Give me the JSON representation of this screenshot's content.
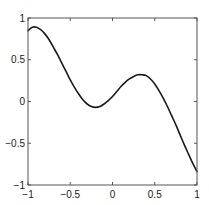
{
  "chart_data": {
    "type": "line",
    "title": "",
    "xlabel": "",
    "ylabel": "",
    "xlim": [
      -1,
      1
    ],
    "ylim": [
      -1,
      1
    ],
    "grid": false,
    "legend": null,
    "x_ticks": [
      -1,
      -0.5,
      0,
      0.5,
      1
    ],
    "x_tick_labels": [
      "−1",
      "−0.5",
      "0",
      "0.5",
      "1"
    ],
    "y_ticks": [
      -1,
      -0.5,
      0,
      0.5,
      1
    ],
    "y_tick_labels": [
      "−1",
      "−0.5",
      "0",
      "0.5",
      "1"
    ],
    "series": [
      {
        "name": "f(x)",
        "color": "#1a1a1a",
        "x": [
          -1.0,
          -0.95,
          -0.9,
          -0.85,
          -0.8,
          -0.75,
          -0.7,
          -0.65,
          -0.6,
          -0.55,
          -0.5,
          -0.45,
          -0.4,
          -0.35,
          -0.3,
          -0.25,
          -0.2,
          -0.15,
          -0.1,
          -0.05,
          0.0,
          0.05,
          0.1,
          0.15,
          0.2,
          0.25,
          0.3,
          0.35,
          0.4,
          0.45,
          0.5,
          0.55,
          0.6,
          0.65,
          0.7,
          0.75,
          0.8,
          0.85,
          0.9,
          0.95,
          1.0
        ],
        "y": [
          0.85,
          0.89,
          0.89,
          0.86,
          0.81,
          0.74,
          0.65,
          0.56,
          0.46,
          0.36,
          0.26,
          0.17,
          0.09,
          0.02,
          -0.03,
          -0.06,
          -0.07,
          -0.06,
          -0.03,
          0.01,
          0.06,
          0.12,
          0.18,
          0.23,
          0.27,
          0.3,
          0.32,
          0.32,
          0.31,
          0.27,
          0.21,
          0.13,
          0.04,
          -0.06,
          -0.17,
          -0.28,
          -0.4,
          -0.52,
          -0.63,
          -0.74,
          -0.84
        ]
      }
    ]
  }
}
